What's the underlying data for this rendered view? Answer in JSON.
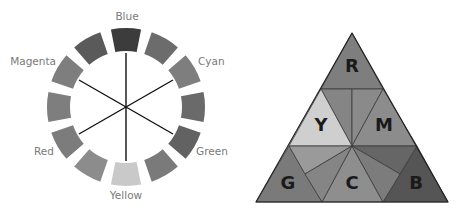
{
  "wheel": {
    "center": [
      126,
      107
    ],
    "outer_radius": 79,
    "inner_radius": 56,
    "segments": [
      {
        "angle": 0,
        "fill": "#3c3c3c"
      },
      {
        "angle": 30,
        "fill": "#6c6c6c"
      },
      {
        "angle": 60,
        "fill": "#7e7e7e"
      },
      {
        "angle": 90,
        "fill": "#6a6a6a"
      },
      {
        "angle": 120,
        "fill": "#626262"
      },
      {
        "angle": 150,
        "fill": "#7a7a7a"
      },
      {
        "angle": 180,
        "fill": "#c9c9c9"
      },
      {
        "angle": 210,
        "fill": "#8c8c8c"
      },
      {
        "angle": 240,
        "fill": "#7c7c7c"
      },
      {
        "angle": 270,
        "fill": "#7e7e7e"
      },
      {
        "angle": 300,
        "fill": "#7e7e7e"
      },
      {
        "angle": 330,
        "fill": "#5a5a5a"
      }
    ],
    "labels": {
      "blue": "Blue",
      "cyan": "Cyan",
      "green": "Green",
      "yellow": "Yellow",
      "red": "Red",
      "magenta": "Magenta"
    }
  },
  "triangle": {
    "letters": {
      "r": "R",
      "y": "Y",
      "m": "M",
      "g": "G",
      "c": "C",
      "b": "B"
    },
    "colors": {
      "r": "#7e7e7e",
      "y": "#cfcfcf",
      "m": "#8c8c8c",
      "g": "#7a7a7a",
      "c": "#8e8e8e",
      "b": "#555555",
      "mix_light": "#9a9a9a",
      "mix_mid": "#858585",
      "mix_dark": "#666666",
      "edge": "#2a2a2a"
    }
  }
}
